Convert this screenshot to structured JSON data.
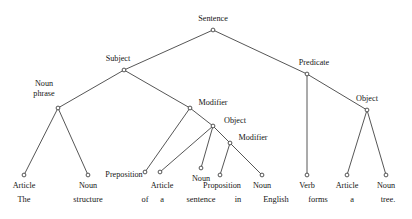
{
  "figure": {
    "stroke_color": "#2b2b2b",
    "text_color": "#151515",
    "background_color": "#ffffff"
  },
  "tree": {
    "nodes": [
      {
        "id": "sentence",
        "label": "Sentence",
        "x": 213,
        "y": 30,
        "label_x": 213,
        "label_y": 21,
        "anchor": "middle",
        "lines": [
          "Sentence"
        ]
      },
      {
        "id": "subject",
        "label": "Subject",
        "x": 124,
        "y": 70,
        "label_x": 118,
        "label_y": 61,
        "anchor": "middle",
        "lines": [
          "Subject"
        ]
      },
      {
        "id": "predicate",
        "label": "Predicate",
        "x": 307,
        "y": 74,
        "label_x": 314,
        "label_y": 65,
        "anchor": "middle",
        "lines": [
          "Predicate"
        ]
      },
      {
        "id": "nounphrase",
        "label": "Noun phrase",
        "x": 58,
        "y": 108,
        "label_x": 44,
        "label_y": 86,
        "anchor": "middle",
        "lines": [
          "Noun",
          "phrase"
        ]
      },
      {
        "id": "modifier1",
        "label": "Modifier",
        "x": 190,
        "y": 108,
        "label_x": 213,
        "label_y": 105,
        "anchor": "middle",
        "lines": [
          "Modifier"
        ]
      },
      {
        "id": "object1",
        "label": "Object",
        "x": 213,
        "y": 126,
        "label_x": 235,
        "label_y": 123,
        "anchor": "middle",
        "lines": [
          "Object"
        ]
      },
      {
        "id": "modifier2",
        "label": "Modifier",
        "x": 230,
        "y": 143,
        "label_x": 253,
        "label_y": 140,
        "anchor": "middle",
        "lines": [
          "Modifier"
        ]
      },
      {
        "id": "object2",
        "label": "Object",
        "x": 367,
        "y": 110,
        "label_x": 367,
        "label_y": 101,
        "anchor": "middle",
        "lines": [
          "Object"
        ]
      }
    ],
    "leaves": [
      {
        "id": "leaf-article-1",
        "label": "Article",
        "x": 24,
        "y": 175,
        "label_x": 24,
        "label_y": 188
      },
      {
        "id": "leaf-noun-1",
        "label": "Noun",
        "x": 88,
        "y": 175,
        "label_x": 88,
        "label_y": 188
      },
      {
        "id": "leaf-preposition",
        "label": "Preposition",
        "x": 145,
        "y": 172,
        "label_x": 124,
        "label_y": 177
      },
      {
        "id": "leaf-article-2",
        "label": "Article",
        "x": 160,
        "y": 172,
        "label_x": 162,
        "label_y": 188
      },
      {
        "id": "leaf-noun-2",
        "label": "Noun",
        "x": 201,
        "y": 168,
        "label_x": 201,
        "label_y": 181
      },
      {
        "id": "leaf-proposition",
        "label": "Proposition",
        "x": 220,
        "y": 175,
        "label_x": 222,
        "label_y": 188
      },
      {
        "id": "leaf-noun-3",
        "label": "Noun",
        "x": 262,
        "y": 175,
        "label_x": 262,
        "label_y": 188
      },
      {
        "id": "leaf-verb",
        "label": "Verb",
        "x": 307,
        "y": 175,
        "label_x": 307,
        "label_y": 188
      },
      {
        "id": "leaf-article-3",
        "label": "Article",
        "x": 347,
        "y": 175,
        "label_x": 347,
        "label_y": 188
      },
      {
        "id": "leaf-noun-4",
        "label": "Noun",
        "x": 386,
        "y": 175,
        "label_x": 386,
        "label_y": 188
      }
    ],
    "edges": [
      {
        "from": "sentence",
        "to": "subject"
      },
      {
        "from": "sentence",
        "to": "predicate"
      },
      {
        "from": "subject",
        "to": "nounphrase"
      },
      {
        "from": "subject",
        "to": "modifier1"
      },
      {
        "from": "predicate",
        "to": "leaf-verb"
      },
      {
        "from": "predicate",
        "to": "object2"
      },
      {
        "from": "nounphrase",
        "to": "leaf-article-1"
      },
      {
        "from": "nounphrase",
        "to": "leaf-noun-1"
      },
      {
        "from": "modifier1",
        "to": "leaf-preposition"
      },
      {
        "from": "modifier1",
        "to": "object1"
      },
      {
        "from": "object1",
        "to": "leaf-article-2"
      },
      {
        "from": "object1",
        "to": "leaf-noun-2"
      },
      {
        "from": "object1",
        "to": "modifier2"
      },
      {
        "from": "modifier2",
        "to": "leaf-proposition"
      },
      {
        "from": "modifier2",
        "to": "leaf-noun-3"
      },
      {
        "from": "object2",
        "to": "leaf-article-3"
      },
      {
        "from": "object2",
        "to": "leaf-noun-4"
      }
    ]
  },
  "sentence_text": {
    "full": "The structure of a sentence in English forms a tree.",
    "words": [
      {
        "text": "The",
        "x": 24
      },
      {
        "text": "structure",
        "x": 88
      },
      {
        "text": "of",
        "x": 145
      },
      {
        "text": "a",
        "x": 162
      },
      {
        "text": "sentence",
        "x": 201
      },
      {
        "text": "in",
        "x": 238
      },
      {
        "text": "English",
        "x": 276
      },
      {
        "text": "forms",
        "x": 318
      },
      {
        "text": "a",
        "x": 352
      },
      {
        "text": "tree.",
        "x": 388
      }
    ]
  }
}
